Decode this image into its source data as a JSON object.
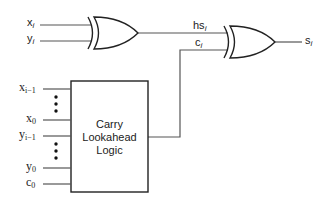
{
  "diagram": {
    "type": "circuit",
    "gates": [
      {
        "id": "xor1",
        "type": "XOR",
        "inputs": [
          "x_i",
          "y_i"
        ],
        "output": "hs_i"
      },
      {
        "id": "xor2",
        "type": "XOR",
        "inputs": [
          "hs_i",
          "c_i"
        ],
        "output": "s_i"
      }
    ],
    "block": {
      "id": "cla",
      "lines": [
        "Carry",
        "Lookahead",
        "Logic"
      ],
      "inputs": [
        "x_{i-1}",
        "x_0",
        "y_{i-1}",
        "y_0",
        "c_0"
      ],
      "output": "c_i"
    }
  },
  "labels": {
    "xi": {
      "base": "x",
      "sub": "i"
    },
    "yi": {
      "base": "y",
      "sub": "i"
    },
    "hsi": {
      "base": "hs",
      "sub": "i"
    },
    "ci": {
      "base": "c",
      "sub": "i"
    },
    "si": {
      "base": "s",
      "sub": "i"
    },
    "x_im1": {
      "base": "x",
      "sub": "i−1"
    },
    "x0": {
      "base": "x",
      "sub": "0"
    },
    "y_im1": {
      "base": "y",
      "sub": "i−1"
    },
    "y0": {
      "base": "y",
      "sub": "0"
    },
    "c0": {
      "base": "c",
      "sub": "0"
    }
  },
  "block_text": {
    "line1": "Carry",
    "line2": "Lookahead",
    "line3": "Logic"
  },
  "colors": {
    "stroke": "#222222",
    "wire": "#555555"
  }
}
